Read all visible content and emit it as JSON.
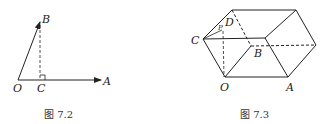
{
  "figures": [
    {
      "id": "fig-7-2",
      "caption": "图 7.2",
      "labels": {
        "O": "O",
        "A": "A",
        "B": "B",
        "C": "C"
      }
    },
    {
      "id": "fig-7-3",
      "caption": "图 7.3",
      "labels": {
        "O": "O",
        "A": "A",
        "B": "B",
        "C": "C",
        "D": "D",
        "P": "P"
      }
    }
  ],
  "colors": {
    "stroke": "#222222",
    "background": "#ffffff"
  }
}
